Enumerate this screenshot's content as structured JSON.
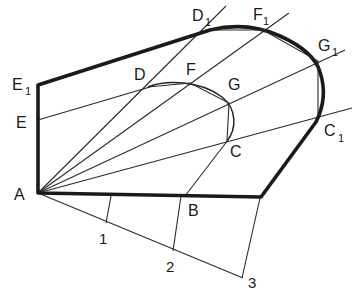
{
  "figure": {
    "labels": {
      "A": "A",
      "B": "B",
      "C": "C",
      "C1": "C",
      "D": "D",
      "D1": "D",
      "E": "E",
      "E1": "E",
      "F": "F",
      "F1": "F",
      "G": "G",
      "G1": "G",
      "sub1": "1",
      "n1": "1",
      "n2": "2",
      "n3": "3"
    },
    "points": {
      "A": [
        38,
        193
      ],
      "B": [
        185,
        196
      ],
      "corner": [
        261,
        197
      ],
      "C": [
        227,
        141
      ],
      "D": [
        148,
        87
      ],
      "E": [
        38,
        120
      ],
      "F": [
        190,
        83
      ],
      "G": [
        229,
        103
      ],
      "C1": [
        318,
        116
      ],
      "D1": [
        210,
        30
      ],
      "E1": [
        38,
        85
      ],
      "F1": [
        263,
        30
      ],
      "G1": [
        318,
        61
      ],
      "P1": [
        106,
        223
      ],
      "P2": [
        173,
        251
      ],
      "P3": [
        242,
        278
      ]
    },
    "colors": {
      "stroke": "#1a1a1a",
      "background": "#ffffff"
    }
  }
}
